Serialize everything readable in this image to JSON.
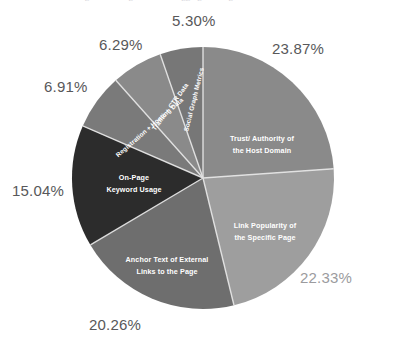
{
  "title_sliver": "Search Engine Ranking Factors — Aggregate Weight of Thematic Clusters",
  "chart_data": {
    "type": "pie",
    "title": "",
    "xlabel": "",
    "ylabel": "",
    "legend_position": "none",
    "grid": false,
    "start_angle_deg": 0,
    "direction": "clockwise",
    "categories": [
      "Trust/ Authority of the Host Domain",
      "Link Popularity of the Specific Page",
      "Anchor Text of External Links to the Page",
      "On-Page Keyword Usage",
      "Registration + Hosting Data",
      "Traffic + CTR Data",
      "Social Graph Metrics"
    ],
    "values": [
      23.87,
      22.33,
      20.26,
      15.04,
      6.91,
      6.29,
      5.3
    ],
    "value_labels": [
      "23.87%",
      "22.33%",
      "20.26%",
      "15.04%",
      "6.91%",
      "6.29%",
      "5.30%"
    ],
    "colors": [
      "#8a8a8a",
      "#9e9e9e",
      "#6e6e6e",
      "#2c2c2c",
      "#7a7a7a",
      "#8a8a8a",
      "#777777"
    ],
    "slices": [
      {
        "name": "trust-authority",
        "label_line1": "Trust/ Authority of",
        "label_line2": "the Host Domain",
        "value": 23.87,
        "value_label": "23.87%",
        "color": "#8a8a8a"
      },
      {
        "name": "link-popularity",
        "label_line1": "Link Popularity of",
        "label_line2": "the Specific Page",
        "value": 22.33,
        "value_label": "22.33%",
        "color": "#9e9e9e"
      },
      {
        "name": "anchor-text",
        "label_line1": "Anchor Text of External",
        "label_line2": "Links to the Page",
        "value": 20.26,
        "value_label": "20.26%",
        "color": "#6e6e6e"
      },
      {
        "name": "on-page-keyword-usage",
        "label_line1": "On-Page",
        "label_line2": "Keyword Usage",
        "value": 15.04,
        "value_label": "15.04%",
        "color": "#2c2c2c"
      },
      {
        "name": "registration-hosting-data",
        "label_line1": "Registration + Hosting Data",
        "label_line2": "",
        "value": 6.91,
        "value_label": "6.91%",
        "color": "#7a7a7a"
      },
      {
        "name": "traffic-ctr-data",
        "label_line1": "Traffic + CTR Data",
        "label_line2": "",
        "value": 6.29,
        "value_label": "6.29%",
        "color": "#8a8a8a"
      },
      {
        "name": "social-graph-metrics",
        "label_line1": "Social Graph Metrics",
        "label_line2": "",
        "value": 5.3,
        "value_label": "5.30%",
        "color": "#777777"
      }
    ]
  }
}
